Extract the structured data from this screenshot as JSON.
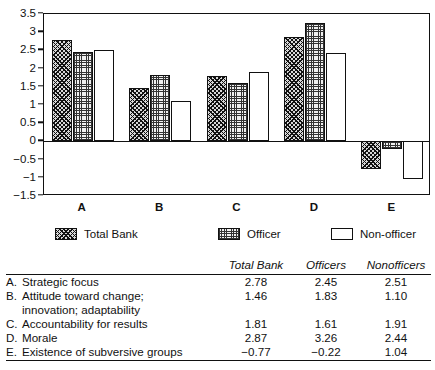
{
  "chart_data": {
    "type": "bar",
    "title": "",
    "xlabel": "",
    "ylabel": "",
    "categories": [
      "A",
      "B",
      "C",
      "D",
      "E"
    ],
    "ylim": [
      -1.5,
      3.5
    ],
    "ytick_labels": [
      "3.5",
      "3",
      "2.5",
      "2",
      "1.5",
      "1",
      "0.5",
      "0",
      "-0.5",
      "-1",
      "-1.5"
    ],
    "ytick_values": [
      3.5,
      3,
      2.5,
      2,
      1.5,
      1,
      0.5,
      0,
      -0.5,
      -1,
      -1.5
    ],
    "grid": false,
    "legend_position": "below-axes",
    "series": [
      {
        "name": "Total Bank",
        "pattern": "diagonal-hatch",
        "values": [
          2.78,
          1.46,
          1.81,
          2.87,
          -0.77
        ]
      },
      {
        "name": "Officer",
        "pattern": "dotted-grid",
        "values": [
          2.45,
          1.83,
          1.61,
          3.26,
          -0.22
        ]
      },
      {
        "name": "Non-officer",
        "pattern": "white",
        "values": [
          2.51,
          1.1,
          1.91,
          2.44,
          -1.04
        ]
      }
    ]
  },
  "legend": {
    "items": [
      {
        "label": "Total Bank"
      },
      {
        "label": "Officer"
      },
      {
        "label": "Non-officer"
      }
    ]
  },
  "table": {
    "headers": [
      "",
      "Total Bank",
      "Officers",
      "Nonofficers"
    ],
    "rows": [
      {
        "key": "A.",
        "label": "Strategic focus",
        "label2": "",
        "total_bank": "2.78",
        "officers": "2.45",
        "nonofficers": "2.51"
      },
      {
        "key": "B.",
        "label": "Attitude toward change;",
        "label2": "innovation; adaptability",
        "total_bank": "1.46",
        "officers": "1.83",
        "nonofficers": "1.10"
      },
      {
        "key": "C.",
        "label": "Accountability for results",
        "label2": "",
        "total_bank": "1.81",
        "officers": "1.61",
        "nonofficers": "1.91"
      },
      {
        "key": "D.",
        "label": "Morale",
        "label2": "",
        "total_bank": "2.87",
        "officers": "3.26",
        "nonofficers": "2.44"
      },
      {
        "key": "E.",
        "label": "Existence of subversive groups",
        "label2": "",
        "total_bank": "−0.77",
        "officers": "−0.22",
        "nonofficers": "1.04"
      }
    ]
  },
  "colors": {
    "ink": "#111111",
    "background": "#ffffff",
    "hatch_fill": "#d8d8d8",
    "dot_fill": "#f0f0f0"
  }
}
